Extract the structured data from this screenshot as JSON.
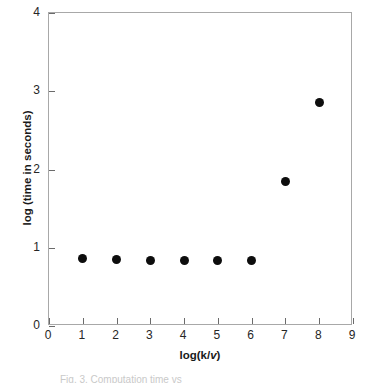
{
  "chart_data": {
    "type": "scatter",
    "title": "",
    "xlabel": "log(k/v)",
    "xlabel_plain": "log(k/",
    "xlabel_italic": "v",
    "xlabel_tail": ")",
    "ylabel": "log (time in seconds)",
    "xlim": [
      0,
      9
    ],
    "ylim": [
      0,
      4
    ],
    "xticks": [
      0,
      1,
      2,
      3,
      4,
      5,
      6,
      7,
      8,
      9
    ],
    "yticks": [
      0,
      1,
      2,
      3,
      4
    ],
    "xtick_labels": [
      "0",
      "1",
      "2",
      "3",
      "4",
      "5",
      "6",
      "7",
      "8",
      "9"
    ],
    "ytick_labels": [
      "0",
      "1",
      "2",
      "3",
      "4"
    ],
    "grid": false,
    "legend": null,
    "marker": "filled-circle",
    "marker_color": "#0d0d0d",
    "frame_color": "#a8a8a8",
    "x": [
      1,
      2,
      3,
      4,
      5,
      6,
      7,
      8
    ],
    "y": [
      0.86,
      0.85,
      0.84,
      0.84,
      0.84,
      0.84,
      1.85,
      2.85
    ],
    "points": [
      {
        "x": 1,
        "y": 0.86
      },
      {
        "x": 2,
        "y": 0.85
      },
      {
        "x": 3,
        "y": 0.84
      },
      {
        "x": 4,
        "y": 0.84
      },
      {
        "x": 5,
        "y": 0.84
      },
      {
        "x": 6,
        "y": 0.84
      },
      {
        "x": 7,
        "y": 1.85
      },
      {
        "x": 8,
        "y": 2.85
      }
    ]
  },
  "caption": {
    "text": "Fig. 3. Computation time vs. log(k/v)",
    "visible_fragment": "Fig. 3. Computation time vs"
  }
}
